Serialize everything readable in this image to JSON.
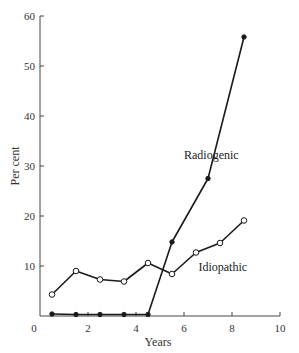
{
  "chart_data": {
    "type": "line",
    "title": "",
    "xlabel": "Years",
    "ylabel": "Per cent",
    "xlim": [
      0,
      10
    ],
    "ylim": [
      0,
      60
    ],
    "x_ticks": [
      0,
      2,
      4,
      6,
      8,
      10
    ],
    "y_ticks": [
      10,
      20,
      30,
      40,
      50,
      60
    ],
    "x_tick_labels": [
      "0",
      "2",
      "4",
      "6",
      "8",
      "10"
    ],
    "y_tick_labels": [
      "10",
      "20",
      "30",
      "40",
      "50",
      "60"
    ],
    "grid": false,
    "legend": "none (inline labels)",
    "series": [
      {
        "name": "Radiogenic",
        "marker": "filled-circle",
        "x": [
          0.5,
          1.5,
          2.5,
          3.5,
          4.5,
          5.5,
          7.0,
          8.5
        ],
        "values": [
          0.4,
          0.3,
          0.3,
          0.3,
          0.3,
          14.8,
          27.5,
          55.8
        ]
      },
      {
        "name": "Idiopathic",
        "marker": "open-circle",
        "x": [
          0.5,
          1.5,
          2.5,
          3.5,
          4.5,
          5.5,
          6.5,
          7.5,
          8.5
        ],
        "values": [
          4.3,
          9.0,
          7.3,
          6.9,
          10.6,
          8.4,
          12.7,
          14.6,
          19.1
        ]
      }
    ],
    "annotations": [
      {
        "text": "Radiogenic",
        "x": 6.0,
        "y": 31.5
      },
      {
        "text": "Idiopathic",
        "x": 6.6,
        "y": 9.0
      }
    ]
  }
}
